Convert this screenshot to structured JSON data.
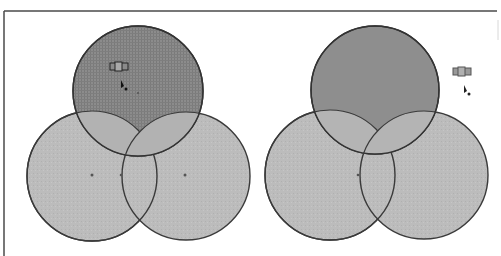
{
  "frame": {
    "top_rule": {
      "x1": 4,
      "x2": 497,
      "y": 11
    },
    "left_rule": {
      "x": 4,
      "y1": 11,
      "y2": 256
    },
    "color": "#4a4a4a"
  },
  "colors": {
    "dark_fill": "#8a8a8a",
    "light_fill": "#bdbdbd",
    "overlap_fill": "#b0b0b0",
    "stroke": "#3a3a3a",
    "background": "#ffffff"
  },
  "panels": [
    {
      "name": "left-venn",
      "circles": [
        {
          "id": "top",
          "cx": 138,
          "cy": 91,
          "r": 65,
          "fill": "dark",
          "pattern": "grid"
        },
        {
          "id": "bottom-left",
          "cx": 92,
          "cy": 176,
          "r": 65,
          "fill": "light"
        },
        {
          "id": "bottom-right",
          "cx": 186,
          "cy": 176,
          "r": 64,
          "fill": "light"
        }
      ],
      "center_dots": [
        [
          92,
          175
        ],
        [
          121,
          175
        ],
        [
          185,
          175
        ]
      ],
      "cursor": {
        "handle_x": 110,
        "handle_y": 62,
        "arrow_x": 122,
        "arrow_y": 82
      }
    },
    {
      "name": "right-venn",
      "circles": [
        {
          "id": "top",
          "cx": 375,
          "cy": 90,
          "r": 64,
          "fill": "dark"
        },
        {
          "id": "bottom-left",
          "cx": 330,
          "cy": 175,
          "r": 65,
          "fill": "light"
        },
        {
          "id": "bottom-right",
          "cx": 424,
          "cy": 175,
          "r": 64,
          "fill": "light"
        }
      ],
      "center_dots": [
        [
          358,
          175
        ]
      ],
      "cursor": {
        "handle_x": 453,
        "handle_y": 67,
        "arrow_x": 465,
        "arrow_y": 87
      }
    }
  ]
}
